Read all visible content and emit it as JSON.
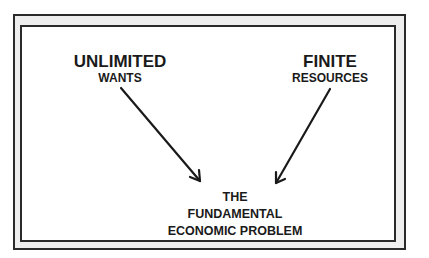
{
  "diagram": {
    "left": {
      "title": "UNLIMITED",
      "subtitle": "WANTS"
    },
    "right": {
      "title": "FINITE",
      "subtitle": "RESOURCES"
    },
    "center": {
      "line1": "THE",
      "line2": "FUNDAMENTAL",
      "line3": "ECONOMIC PROBLEM"
    },
    "colors": {
      "ink": "#1a1a1a",
      "frame_fill": "#eeeeee",
      "background": "#ffffff"
    }
  }
}
